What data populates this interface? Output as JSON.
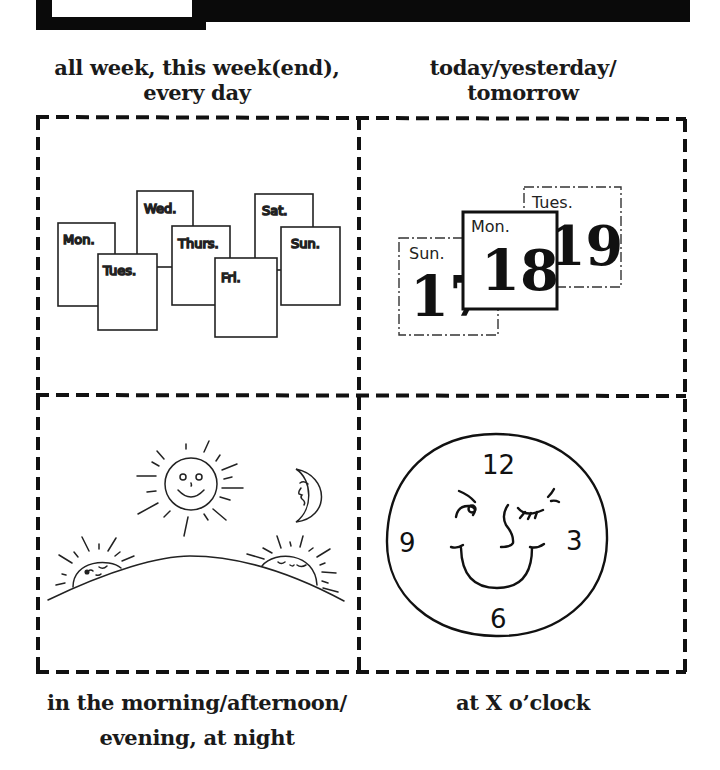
{
  "header": {
    "banner": "black-header-bar",
    "tab": "blank-header-tab"
  },
  "panels": [
    {
      "id": "week",
      "caption_lines": [
        "all week, this week(end),",
        "every day"
      ],
      "illustration": "weekday-calendar-pages",
      "days": [
        "Mon.",
        "Tues.",
        "Wed.",
        "Thurs.",
        "Fri.",
        "Sat.",
        "Sun."
      ]
    },
    {
      "id": "days",
      "caption_lines": [
        "today/yesterday/",
        "tomorrow"
      ],
      "illustration": "daily-calendar-pages",
      "pages": [
        {
          "day": "Sun.",
          "date": "17"
        },
        {
          "day": "Mon.",
          "date": "18"
        },
        {
          "day": "Tues.",
          "date": "19"
        }
      ]
    },
    {
      "id": "times-of-day",
      "caption_lines": [
        "in the morning/afternoon/",
        "evening, at night"
      ],
      "illustration": "sun-and-moon-over-hill"
    },
    {
      "id": "clock",
      "caption_lines": [
        "at X o’clock"
      ],
      "illustration": "winking-clock-face",
      "clock_numbers": [
        "12",
        "3",
        "6",
        "9"
      ]
    }
  ],
  "colors": {
    "ink": "#111111",
    "paper": "#ffffff"
  }
}
